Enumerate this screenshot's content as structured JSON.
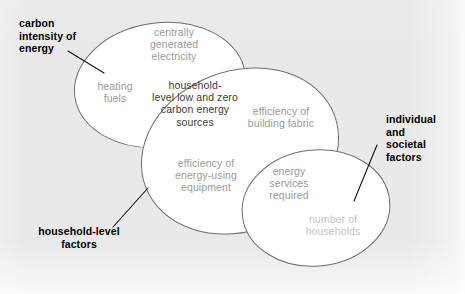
{
  "figure": {
    "background_color": "#e9e9e9",
    "ellipse_fill": "#ffffff",
    "ellipse_stroke": "#6e6e6e",
    "callout_color": "#000000"
  },
  "diagram": {
    "type": "venn-three-ellipse",
    "ellipses": [
      {
        "id": "energy-supply",
        "callout": "carbon intensity of energy",
        "interior_labels": [
          "centrally generated electricity",
          "heating fuels"
        ]
      },
      {
        "id": "household",
        "callout": "household-level factors",
        "interior_labels": [
          "efficiency of building fabric",
          "efficiency of energy-using equipment"
        ]
      },
      {
        "id": "societal",
        "callout": "individual and societal factors",
        "interior_labels": [
          "number of households"
        ]
      }
    ],
    "intersections": [
      {
        "id": "energy-supply-household",
        "label": "household-level low and zero carbon energy sources"
      },
      {
        "id": "household-societal",
        "label": "energy services required"
      }
    ]
  },
  "labels": {
    "centrally_generated_electricity": "centrally\ngenerated\nelectricity",
    "heating_fuels": "heating\nfuels",
    "household_low_zero_carbon": "household-\nlevel low and zero\ncarbon energy\nsources",
    "efficiency_building_fabric": "efficiency of\nbuilding fabric",
    "efficiency_energy_using_equipment": "efficiency of\nenergy-using\nequipment",
    "energy_services_required": "energy\nservices\nrequired",
    "number_of_households": "number of\nhouseholds"
  },
  "callouts": {
    "carbon_intensity_of_energy": "carbon\nintensity of\nenergy",
    "household_level_factors": "household-level\nfactors",
    "individual_and_societal_factors": "individual\nand\nsocietal\nfactors"
  }
}
